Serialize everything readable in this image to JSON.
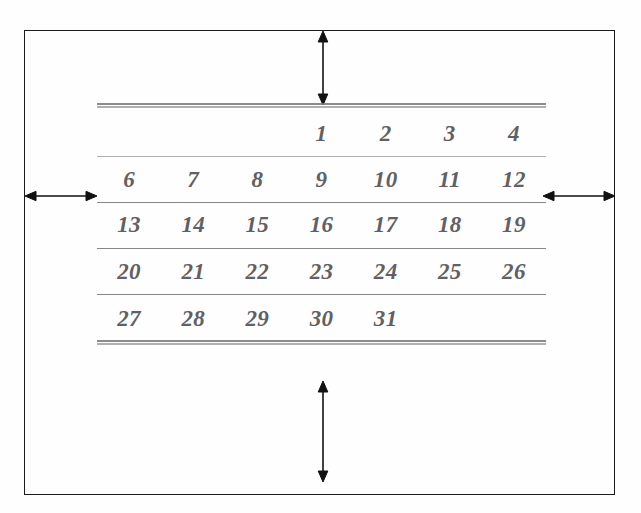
{
  "diagram": {
    "border_color": "#1b1b1b",
    "rule_color": "#9a9a9a",
    "numeral_color": "#5f6164"
  },
  "calendar": {
    "columns": 7,
    "rows": [
      {
        "name": "week-1",
        "cells": [
          "",
          "",
          "",
          "1",
          "2",
          "3",
          "4",
          "5"
        ]
      },
      {
        "name": "week-2",
        "cells": [
          "6",
          "7",
          "8",
          "9",
          "10",
          "11",
          "12"
        ]
      },
      {
        "name": "week-3",
        "cells": [
          "13",
          "14",
          "15",
          "16",
          "17",
          "18",
          "19"
        ]
      },
      {
        "name": "week-4",
        "cells": [
          "20",
          "21",
          "22",
          "23",
          "24",
          "25",
          "26"
        ]
      },
      {
        "name": "week-5",
        "cells": [
          "27",
          "28",
          "29",
          "30",
          "31",
          "",
          ""
        ]
      }
    ],
    "days": {
      "r1": [
        "",
        "",
        "",
        "1",
        "2",
        "3",
        "4",
        "5"
      ],
      "r2": [
        "6",
        "7",
        "8",
        "9",
        "10",
        "11",
        "12"
      ],
      "r3": [
        "13",
        "14",
        "15",
        "16",
        "17",
        "18",
        "19"
      ],
      "r4": [
        "20",
        "21",
        "22",
        "23",
        "24",
        "25",
        "26"
      ],
      "r5": [
        "27",
        "28",
        "29",
        "30",
        "31",
        "",
        ""
      ]
    }
  },
  "annotations": {
    "top_arrow": {
      "name": "top-margin-arrow",
      "orientation": "vertical",
      "heads": "double"
    },
    "bottom_arrow": {
      "name": "bottom-margin-arrow",
      "orientation": "vertical",
      "heads": "double"
    },
    "left_arrow": {
      "name": "left-margin-arrow",
      "orientation": "horizontal",
      "heads": "double"
    },
    "right_arrow": {
      "name": "right-margin-arrow",
      "orientation": "horizontal",
      "heads": "double"
    }
  }
}
